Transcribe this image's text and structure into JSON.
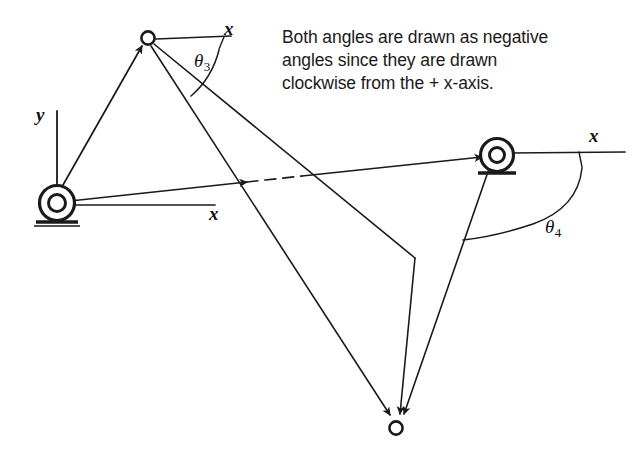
{
  "figure": {
    "kind": "four-bar-linkage-kinematic-diagram",
    "note": {
      "lines": [
        "Both angles are drawn as negative",
        "angles since they are drawn",
        "clockwise from the + x-axis."
      ]
    },
    "labels": {
      "y_axis_left": "y",
      "x_axis_left": "x",
      "x_axis_top": "x",
      "x_axis_right": "x",
      "theta3_symbol": "θ",
      "theta3_subscript": "3",
      "theta4_symbol": "θ",
      "theta4_subscript": "4"
    },
    "colors": {
      "stroke": "#1a1a1a",
      "background": "#ffffff",
      "text": "#1a1a1a"
    },
    "joints": [
      {
        "name": "ground-pivot-left",
        "type": "grounded-pin",
        "x": 57,
        "y": 203
      },
      {
        "name": "ground-pivot-right",
        "type": "grounded-pin",
        "x": 497,
        "y": 155
      },
      {
        "name": "joint-top",
        "type": "pin",
        "x": 148,
        "y": 38
      },
      {
        "name": "joint-bottom",
        "type": "pin",
        "x": 396,
        "y": 428
      },
      {
        "name": "link-bend-vertex",
        "type": "corner",
        "x": 415,
        "y": 258
      }
    ],
    "links": [
      {
        "name": "link2-left-crank",
        "from": "ground-pivot-left",
        "to": "joint-top"
      },
      {
        "name": "link1-ground",
        "from": "ground-pivot-left",
        "to": "ground-pivot-right",
        "dashed_middle": true
      },
      {
        "name": "link3-coupler-upper",
        "from": "joint-top",
        "to": "link-bend-vertex"
      },
      {
        "name": "link3-coupler-lower",
        "from": "joint-top",
        "to": "joint-bottom"
      },
      {
        "name": "link-vertex-to-bottom",
        "from": "link-bend-vertex",
        "to": "joint-bottom"
      },
      {
        "name": "link4-right-rocker",
        "from": "ground-pivot-right",
        "to": "joint-bottom"
      }
    ],
    "axes": [
      {
        "name": "y-axis-left",
        "origin": "ground-pivot-left",
        "direction": "up"
      },
      {
        "name": "x-axis-left",
        "origin": "ground-pivot-left",
        "direction": "right"
      },
      {
        "name": "x-axis-top",
        "origin": "joint-top",
        "direction": "right"
      },
      {
        "name": "x-axis-right",
        "origin": "ground-pivot-right",
        "direction": "right"
      }
    ],
    "angles": [
      {
        "name": "theta3",
        "vertex": "joint-top",
        "sense": "clockwise-negative"
      },
      {
        "name": "theta4",
        "vertex": "ground-pivot-right",
        "sense": "clockwise-negative"
      }
    ]
  }
}
